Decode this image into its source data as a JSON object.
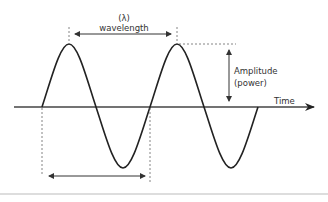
{
  "diagram": {
    "labels": {
      "lambda": "(λ)",
      "wavelength": "wavelength",
      "amplitude_line1": "Amplitude",
      "amplitude_line2": "(power)",
      "time": "Time"
    },
    "colors": {
      "wave": "#222222",
      "axis": "#444444",
      "dashed": "#666666",
      "arrow": "#333333",
      "bottom_rule": "#bbbbbb"
    }
  }
}
